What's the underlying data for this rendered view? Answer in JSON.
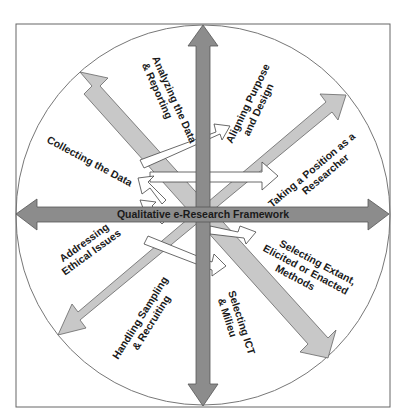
{
  "diagram": {
    "title": "Qualitative e-Research Framework",
    "colors": {
      "frame": "#666666",
      "circle": "#777777",
      "axis_arrow_fill": "#8c8c8c",
      "axis_arrow_stroke": "#555555",
      "diagonal_arrow_fill": "#c8c8c8",
      "diagonal_arrow_stroke": "#666666",
      "cycle_arrow_fill": "#ffffff",
      "cycle_arrow_stroke": "#444444",
      "text": "#1a1a1a"
    },
    "labels": {
      "analyzing": [
        "Analyzing the Data",
        "& Reporting"
      ],
      "aligning": [
        "Aligning Purpose",
        "and Design"
      ],
      "position": [
        "Taking a Position as a",
        "Researcher"
      ],
      "methods": [
        "Selecting Extant,",
        "Elicited or Enacted",
        "Methods"
      ],
      "ict": [
        "Selecting ICT",
        "& Milieu"
      ],
      "sampling": [
        "Handling Sampling",
        "& Recruiting"
      ],
      "ethics": [
        "Addressing",
        "Ethical Issues"
      ],
      "collecting": [
        "Collecting the Data"
      ]
    }
  }
}
